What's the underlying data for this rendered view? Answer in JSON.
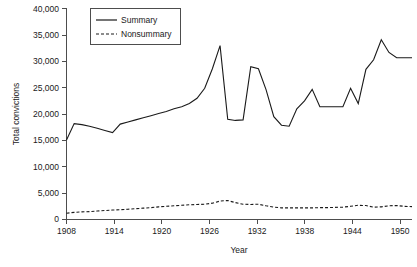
{
  "chart_data": {
    "type": "line",
    "title": "",
    "xlabel": "Year",
    "ylabel": "Total convictions",
    "xlim": [
      1908,
      1953
    ],
    "ylim": [
      0,
      40000
    ],
    "grid": false,
    "legend_position": "top-left",
    "x_ticks": [
      1908,
      1914,
      1920,
      1926,
      1932,
      1938,
      1944,
      1950
    ],
    "x_tick_labels": [
      "1908",
      "1914",
      "1920",
      "1926",
      "1932",
      "1938",
      "1944",
      "1950"
    ],
    "y_ticks": [
      0,
      5000,
      10000,
      15000,
      20000,
      25000,
      30000,
      35000,
      40000
    ],
    "y_tick_labels": [
      "0",
      "5,000",
      "10,000",
      "15,000",
      "20,000",
      "25,000",
      "30,000",
      "35,000",
      "40,000"
    ],
    "x": [
      1908,
      1909,
      1910,
      1911,
      1912,
      1913,
      1914,
      1915,
      1916,
      1917,
      1918,
      1919,
      1920,
      1921,
      1922,
      1923,
      1924,
      1925,
      1926,
      1927,
      1928,
      1929,
      1930,
      1931,
      1932,
      1933,
      1934,
      1935,
      1936,
      1937,
      1938,
      1939,
      1940,
      1941,
      1942,
      1943,
      1944,
      1945,
      1946,
      1947,
      1948,
      1949,
      1950,
      1951,
      1952,
      1953
    ],
    "series": [
      {
        "name": "Summary",
        "style": "solid",
        "values": [
          15100,
          18200,
          18000,
          17700,
          17300,
          16900,
          16500,
          18100,
          18500,
          18900,
          19300,
          19700,
          20100,
          20500,
          21000,
          21400,
          22000,
          23000,
          24900,
          28600,
          33000,
          19000,
          18800,
          18900,
          29000,
          28600,
          24600,
          19500,
          17900,
          17700,
          21000,
          22500,
          24700,
          21400,
          21400,
          21400,
          21400,
          24900,
          22000,
          28500,
          30300,
          34100,
          31700,
          30700,
          30700,
          30700
        ]
      },
      {
        "name": "Nonsummary",
        "style": "dashed",
        "values": [
          1200,
          1350,
          1450,
          1500,
          1600,
          1700,
          1800,
          1850,
          1950,
          2050,
          2150,
          2250,
          2400,
          2500,
          2600,
          2700,
          2800,
          2850,
          2900,
          3100,
          3500,
          3600,
          3200,
          2900,
          2850,
          2900,
          2600,
          2350,
          2200,
          2200,
          2200,
          2200,
          2200,
          2250,
          2250,
          2300,
          2350,
          2500,
          2700,
          2650,
          2350,
          2400,
          2600,
          2650,
          2500,
          2450
        ]
      }
    ]
  },
  "legend": {
    "entries": [
      {
        "label": "Summary",
        "style": "solid"
      },
      {
        "label": "Nonsummary",
        "style": "dashed"
      }
    ]
  },
  "axes": {
    "y_title": "Total convictions",
    "x_title": "Year"
  }
}
